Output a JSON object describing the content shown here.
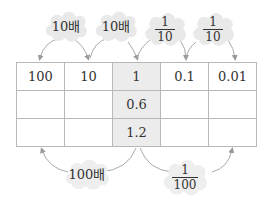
{
  "top_labels": [
    {
      "text": "10배"
    },
    {
      "text": "10배"
    },
    {
      "numerator": "1",
      "denominator": "10"
    },
    {
      "numerator": "1",
      "denominator": "10"
    }
  ],
  "table": {
    "rows": [
      [
        "100",
        "10",
        "1",
        "0.1",
        "0.01"
      ],
      [
        "",
        "",
        "0.6",
        "",
        ""
      ],
      [
        "",
        "",
        "1.2",
        "",
        ""
      ]
    ],
    "highlight_column": 2
  },
  "bottom_labels": [
    {
      "text": "100배"
    },
    {
      "numerator": "1",
      "denominator": "100"
    }
  ],
  "colors": {
    "cloud_fill": "#e9e9e9",
    "highlight_column": "#ececec",
    "grid_line": "#b8b8b8",
    "arrow": "#999999"
  }
}
